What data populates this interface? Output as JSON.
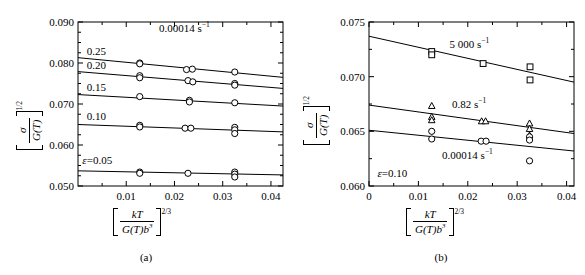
{
  "figure": {
    "panels": [
      {
        "id": "a",
        "caption": "(a)",
        "axis": {
          "x_label_num": "kT",
          "x_label_den": "G(T)b",
          "x_label_den_exp": "3",
          "x_label_exp": "2/3",
          "y_label_num": "σ",
          "y_label_den": "G(T)",
          "y_label_exp": "1/2",
          "x_ticks": [
            "0.01",
            "0.02",
            "0.03",
            "0.04"
          ],
          "y_ticks": [
            "0.090",
            "0.080",
            "0.070",
            "0.060",
            "0.050"
          ],
          "xlim": [
            0.0,
            0.0425
          ],
          "ylim": [
            0.05,
            0.09
          ],
          "x_major": [
            0.01,
            0.02,
            0.03,
            0.04
          ],
          "x_minor_step": 0.005,
          "y_major": [
            0.05,
            0.06,
            0.07,
            0.08,
            0.09
          ],
          "y_minor_step": 0.0025
        },
        "annotations": [
          {
            "name": "strain-rate-annotation",
            "text": "0.00014 s",
            "sup": "−1",
            "x": 0.0168,
            "y": 0.0884
          },
          {
            "name": "curve-label-025",
            "text": "0.25",
            "x": 0.0018,
            "y": 0.0828
          },
          {
            "name": "curve-label-020",
            "text": "0.20",
            "x": 0.0018,
            "y": 0.0793
          },
          {
            "name": "curve-label-015",
            "text": "0.15",
            "x": 0.0018,
            "y": 0.0739
          },
          {
            "name": "curve-label-010",
            "text": "0.10",
            "x": 0.0018,
            "y": 0.0668
          },
          {
            "name": "curve-label-epsilon-005",
            "text": "ε=0.05",
            "italic_prefix": true,
            "x": 0.0009,
            "y": 0.0562
          }
        ]
      },
      {
        "id": "b",
        "caption": "(b)",
        "axis": {
          "x_label_num": "kT",
          "x_label_den": "G(T)b",
          "x_label_den_exp": "3",
          "x_label_exp": "2/3",
          "y_label_num": "σ",
          "y_label_den": "G(T)",
          "y_label_exp": "1/2",
          "x_ticks": [
            "0",
            "0.01",
            "0.02",
            "0.03",
            "0.04"
          ],
          "y_ticks": [
            "0.075",
            "0.070",
            "0.065",
            "0.060"
          ],
          "xlim": [
            0.0,
            0.0415
          ],
          "ylim": [
            0.06,
            0.075
          ],
          "x_major": [
            0.0,
            0.01,
            0.02,
            0.03,
            0.04
          ],
          "x_minor_step": 0.005,
          "y_major": [
            0.06,
            0.065,
            0.07,
            0.075
          ],
          "y_minor_step": 0.0025
        },
        "annotations": [
          {
            "name": "series-label-5000",
            "text": "5 000 s",
            "sup": "−1",
            "x": 0.0163,
            "y": 0.0729
          },
          {
            "name": "series-label-082",
            "text": "0.82 s",
            "sup": "−1",
            "x": 0.0168,
            "y": 0.0674
          },
          {
            "name": "series-label-000014",
            "text": "0.00014 s",
            "sup": "−1",
            "x": 0.0148,
            "y": 0.0627
          },
          {
            "name": "strain-annotation-epsilon-010",
            "text": "ε=0.10",
            "italic_prefix": true,
            "x": 0.0017,
            "y": 0.0611
          }
        ]
      }
    ]
  },
  "chart_data": [
    {
      "type": "scatter",
      "panel": "a",
      "title": "",
      "xlabel": "[kT/(G(T)b^3)]^(2/3)",
      "ylabel": "[sigma/G(T)]^(1/2)",
      "xlim": [
        0.0,
        0.0425
      ],
      "ylim": [
        0.05,
        0.09
      ],
      "xticks": [
        0.01,
        0.02,
        0.03,
        0.04
      ],
      "yticks": [
        0.05,
        0.06,
        0.07,
        0.08,
        0.09
      ],
      "grid": false,
      "legend": "none",
      "condition": "0.00014 s^-1",
      "series": [
        {
          "name": "0.25",
          "marker": "circle",
          "fit_line": {
            "x0": 0.0,
            "y0": 0.0813,
            "x1": 0.0425,
            "y1": 0.0765
          },
          "points": [
            {
              "x": 0.0128,
              "y": 0.08
            },
            {
              "x": 0.0128,
              "y": 0.0798
            },
            {
              "x": 0.0225,
              "y": 0.0784
            },
            {
              "x": 0.0237,
              "y": 0.0785
            },
            {
              "x": 0.0325,
              "y": 0.0778
            }
          ]
        },
        {
          "name": "0.20",
          "marker": "circle",
          "fit_line": {
            "x0": 0.0,
            "y0": 0.0779,
            "x1": 0.0425,
            "y1": 0.0738
          },
          "points": [
            {
              "x": 0.0128,
              "y": 0.0769
            },
            {
              "x": 0.0128,
              "y": 0.0764
            },
            {
              "x": 0.0228,
              "y": 0.0757
            },
            {
              "x": 0.0238,
              "y": 0.0754
            },
            {
              "x": 0.0325,
              "y": 0.075
            },
            {
              "x": 0.0325,
              "y": 0.0746
            }
          ]
        },
        {
          "name": "0.15",
          "marker": "circle",
          "fit_line": {
            "x0": 0.0,
            "y0": 0.0723,
            "x1": 0.0425,
            "y1": 0.0695
          },
          "points": [
            {
              "x": 0.0128,
              "y": 0.0718
            },
            {
              "x": 0.0231,
              "y": 0.0709
            },
            {
              "x": 0.0231,
              "y": 0.0705
            },
            {
              "x": 0.0325,
              "y": 0.0703
            }
          ]
        },
        {
          "name": "0.10",
          "marker": "circle",
          "fit_line": {
            "x0": 0.0,
            "y0": 0.065,
            "x1": 0.0425,
            "y1": 0.0632
          },
          "points": [
            {
              "x": 0.0128,
              "y": 0.0648
            },
            {
              "x": 0.0128,
              "y": 0.0644
            },
            {
              "x": 0.0222,
              "y": 0.0641
            },
            {
              "x": 0.0234,
              "y": 0.0641
            },
            {
              "x": 0.0325,
              "y": 0.0643
            },
            {
              "x": 0.0325,
              "y": 0.0637
            },
            {
              "x": 0.0325,
              "y": 0.0628
            }
          ]
        },
        {
          "name": "0.05",
          "marker": "circle",
          "fit_line": {
            "x0": 0.0,
            "y0": 0.0537,
            "x1": 0.0425,
            "y1": 0.0527
          },
          "points": [
            {
              "x": 0.0128,
              "y": 0.0534
            },
            {
              "x": 0.0128,
              "y": 0.0531
            },
            {
              "x": 0.0228,
              "y": 0.0531
            },
            {
              "x": 0.0325,
              "y": 0.0534
            },
            {
              "x": 0.0325,
              "y": 0.0529
            },
            {
              "x": 0.0325,
              "y": 0.0522
            }
          ]
        }
      ]
    },
    {
      "type": "scatter",
      "panel": "b",
      "title": "",
      "xlabel": "[kT/(G(T)b^3)]^(2/3)",
      "ylabel": "[sigma/G(T)]^(1/2)",
      "xlim": [
        0.0,
        0.0415
      ],
      "ylim": [
        0.06,
        0.075
      ],
      "xticks": [
        0.0,
        0.01,
        0.02,
        0.03,
        0.04
      ],
      "yticks": [
        0.06,
        0.065,
        0.07,
        0.075
      ],
      "grid": false,
      "legend": "inline-labels",
      "condition": "strain = 0.10",
      "series": [
        {
          "name": "5 000 s^-1",
          "marker": "square",
          "fit_line": {
            "x0": 0.0,
            "y0": 0.0737,
            "x1": 0.0415,
            "y1": 0.0695
          },
          "points": [
            {
              "x": 0.0127,
              "y": 0.0723
            },
            {
              "x": 0.0127,
              "y": 0.072
            },
            {
              "x": 0.0231,
              "y": 0.0712
            },
            {
              "x": 0.0326,
              "y": 0.0709
            },
            {
              "x": 0.0326,
              "y": 0.0697
            }
          ]
        },
        {
          "name": "0.82 s^-1",
          "marker": "triangle",
          "fit_line": {
            "x0": 0.0,
            "y0": 0.0674,
            "x1": 0.0415,
            "y1": 0.0648
          },
          "points": [
            {
              "x": 0.0127,
              "y": 0.0673
            },
            {
              "x": 0.0127,
              "y": 0.0663
            },
            {
              "x": 0.0127,
              "y": 0.066
            },
            {
              "x": 0.0228,
              "y": 0.0659
            },
            {
              "x": 0.0236,
              "y": 0.0659
            },
            {
              "x": 0.0325,
              "y": 0.0657
            },
            {
              "x": 0.0325,
              "y": 0.0652
            },
            {
              "x": 0.0325,
              "y": 0.0646
            }
          ]
        },
        {
          "name": "0.00014 s^-1",
          "marker": "circle",
          "fit_line": {
            "x0": 0.0,
            "y0": 0.0651,
            "x1": 0.0415,
            "y1": 0.0632
          },
          "points": [
            {
              "x": 0.0127,
              "y": 0.065
            },
            {
              "x": 0.0127,
              "y": 0.0643
            },
            {
              "x": 0.0227,
              "y": 0.0641
            },
            {
              "x": 0.0237,
              "y": 0.0641
            },
            {
              "x": 0.0325,
              "y": 0.0645
            },
            {
              "x": 0.0325,
              "y": 0.0642
            },
            {
              "x": 0.0325,
              "y": 0.0623
            }
          ]
        }
      ]
    }
  ]
}
